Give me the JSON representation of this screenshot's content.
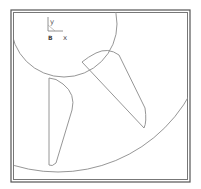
{
  "viewport": {
    "name": "cad-2d-view",
    "background": "#ffffff"
  },
  "frame": {
    "outer_color": "#555555",
    "inner_color": "#888888"
  },
  "axis_indicator": {
    "y_label": "y",
    "x_label": "x",
    "origin_label": "B"
  },
  "geometry": {
    "stroke_color": "#8a8a8a",
    "small_circle": {
      "cx": 64,
      "cy": 24,
      "r": 53
    },
    "large_circle": {
      "cx": 64,
      "cy": 24,
      "r": 152
    }
  }
}
